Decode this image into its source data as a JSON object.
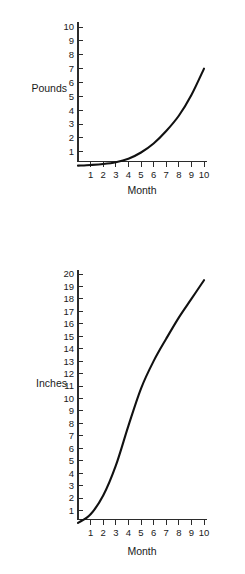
{
  "figure": {
    "background_color": "#ffffff",
    "line_color": "#111111",
    "axis_color": "#2b2b2b",
    "cut_off_caption": " "
  },
  "charts": [
    {
      "id": "pounds",
      "ylabel": "Pounds",
      "xlabel": "Month",
      "yticks": [
        "1",
        "2",
        "3",
        "4",
        "5",
        "6",
        "7",
        "8",
        "9",
        "10"
      ],
      "xticks": [
        "1",
        "2",
        "3",
        "4",
        "5",
        "6",
        "7",
        "8",
        "9",
        "10"
      ]
    },
    {
      "id": "inches",
      "ylabel": "Inches",
      "xlabel": "Month",
      "yticks": [
        "1",
        "2",
        "3",
        "4",
        "5",
        "6",
        "7",
        "8",
        "9",
        "10",
        "11",
        "12",
        "13",
        "14",
        "15",
        "16",
        "17",
        "18",
        "19",
        "20"
      ],
      "xticks": [
        "1",
        "2",
        "3",
        "4",
        "5",
        "6",
        "7",
        "8",
        "9",
        "10"
      ]
    }
  ],
  "chart_data": [
    {
      "type": "line",
      "title": "",
      "xlabel": "Month",
      "ylabel": "Pounds",
      "xlim": [
        0,
        10
      ],
      "ylim": [
        0,
        10.6
      ],
      "grid": false,
      "legend": "none",
      "xticks": [
        1,
        2,
        3,
        4,
        5,
        6,
        7,
        8,
        9,
        10
      ],
      "yticks": [
        1,
        2,
        3,
        4,
        5,
        6,
        7,
        8,
        9,
        10
      ],
      "x": [
        0,
        1,
        2,
        3,
        4,
        5,
        6,
        7,
        8,
        9,
        10
      ],
      "values": [
        0.0,
        0.05,
        0.12,
        0.25,
        0.5,
        0.95,
        1.6,
        2.5,
        3.6,
        5.1,
        7.0
      ],
      "series": [
        {
          "name": "Weight gain",
          "values": [
            0.0,
            0.05,
            0.12,
            0.25,
            0.5,
            0.95,
            1.6,
            2.5,
            3.6,
            5.1,
            7.0
          ]
        }
      ]
    },
    {
      "type": "line",
      "title": "",
      "xlabel": "Month",
      "ylabel": "Inches",
      "xlim": [
        0,
        10
      ],
      "ylim": [
        0,
        20.9
      ],
      "grid": false,
      "legend": "none",
      "xticks": [
        1,
        2,
        3,
        4,
        5,
        6,
        7,
        8,
        9,
        10
      ],
      "yticks": [
        1,
        2,
        3,
        4,
        5,
        6,
        7,
        8,
        9,
        10,
        11,
        12,
        13,
        14,
        15,
        16,
        17,
        18,
        19,
        20
      ],
      "x": [
        0,
        1,
        2,
        3,
        4,
        5,
        6,
        7,
        8,
        9,
        10
      ],
      "values": [
        0.0,
        0.7,
        2.2,
        4.6,
        7.8,
        10.8,
        13.0,
        14.8,
        16.5,
        18.0,
        19.5
      ],
      "series": [
        {
          "name": "Length gain",
          "values": [
            0.0,
            0.7,
            2.2,
            4.6,
            7.8,
            10.8,
            13.0,
            14.8,
            16.5,
            18.0,
            19.5
          ]
        }
      ]
    }
  ]
}
